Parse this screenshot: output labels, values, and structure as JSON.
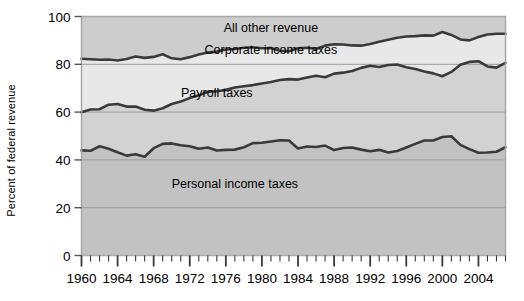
{
  "chart_data": {
    "type": "area",
    "title": "",
    "subtitle": "",
    "xlabel": "",
    "ylabel": "Percent of federal revenue",
    "xlim": [
      1960,
      2007
    ],
    "ylim": [
      0,
      100
    ],
    "grid": true,
    "stacked": true,
    "legend_position": "inline-annotations",
    "y_ticks": [
      0,
      20,
      40,
      60,
      80,
      100
    ],
    "y_tick_labels": [
      "0",
      "20",
      "40",
      "60",
      "80",
      "100"
    ],
    "x_ticks": [
      1960,
      1964,
      1968,
      1972,
      1976,
      1980,
      1984,
      1988,
      1992,
      1996,
      2000,
      2004
    ],
    "x_tick_labels": [
      "1960",
      "1964",
      "1968",
      "1972",
      "1976",
      "1980",
      "1984",
      "1988",
      "1992",
      "1996",
      "2000",
      "2004"
    ],
    "x_minor_tick_interval": 1,
    "annotations": [
      {
        "text": "All other revenue",
        "x": 1981,
        "y": 95
      },
      {
        "text": "Corporate income taxes",
        "x": 1981,
        "y": 86
      },
      {
        "text": "Payroll taxes",
        "x": 1975,
        "y": 68
      },
      {
        "text": "Personal income taxes",
        "x": 1977,
        "y": 30
      }
    ],
    "colors": {
      "all_other_revenue": "#cdcdcd",
      "corporate_income_taxes": "#e8e8e8",
      "payroll_taxes": "#d2d2d2",
      "personal_income_taxes": "#c2c2c2",
      "line": "#3a3a3a",
      "grid": "#9a9a9a",
      "frame": "#a8a8a8",
      "text": "#000000",
      "background": "#ffffff"
    },
    "x": [
      1960,
      1961,
      1962,
      1963,
      1964,
      1965,
      1966,
      1967,
      1968,
      1969,
      1970,
      1971,
      1972,
      1973,
      1974,
      1975,
      1976,
      1977,
      1978,
      1979,
      1980,
      1981,
      1982,
      1983,
      1984,
      1985,
      1986,
      1987,
      1988,
      1989,
      1990,
      1991,
      1992,
      1993,
      1994,
      1995,
      1996,
      1997,
      1998,
      1999,
      2000,
      2001,
      2002,
      2003,
      2004,
      2005,
      2006,
      2007
    ],
    "series": [
      {
        "name": "Personal income taxes",
        "cumulative_top": [
          44.0,
          43.8,
          45.7,
          44.7,
          43.2,
          41.8,
          42.4,
          41.3,
          44.9,
          46.7,
          46.9,
          46.1,
          45.7,
          44.7,
          45.2,
          43.9,
          44.2,
          44.3,
          45.3,
          47.0,
          47.2,
          47.7,
          48.2,
          48.1,
          44.8,
          45.6,
          45.4,
          46.0,
          44.1,
          45.0,
          45.2,
          44.3,
          43.6,
          44.2,
          43.1,
          43.7,
          45.2,
          46.7,
          48.1,
          48.1,
          49.6,
          49.9,
          46.3,
          44.5,
          43.0,
          43.1,
          43.4,
          45.3
        ]
      },
      {
        "name": "Payroll taxes",
        "cumulative_top": [
          59.9,
          61.1,
          61.2,
          63.1,
          63.4,
          62.3,
          62.3,
          61.0,
          60.6,
          61.6,
          63.4,
          64.4,
          65.9,
          67.0,
          68.5,
          68.7,
          69.3,
          70.3,
          70.8,
          71.3,
          72.0,
          72.6,
          73.4,
          73.8,
          73.6,
          74.5,
          75.2,
          74.6,
          76.1,
          76.5,
          77.2,
          78.5,
          79.4,
          78.9,
          79.7,
          79.9,
          78.8,
          78.0,
          77.0,
          76.2,
          75.0,
          76.8,
          79.8,
          81.0,
          81.3,
          79.1,
          78.6,
          80.6
        ]
      },
      {
        "name": "Corporate income taxes",
        "cumulative_top": [
          82.3,
          82.1,
          81.9,
          82.0,
          81.6,
          82.2,
          83.3,
          82.7,
          83.1,
          84.2,
          82.5,
          82.1,
          83.0,
          84.1,
          84.9,
          85.3,
          86.2,
          86.4,
          86.9,
          87.1,
          86.7,
          86.8,
          85.7,
          85.4,
          86.7,
          86.9,
          86.4,
          87.8,
          88.4,
          88.3,
          87.9,
          87.8,
          88.5,
          89.4,
          90.3,
          91.1,
          91.6,
          91.8,
          92.1,
          92.0,
          93.5,
          92.3,
          90.4,
          90.0,
          91.4,
          92.5,
          92.8,
          92.8
        ]
      },
      {
        "name": "All other revenue",
        "cumulative_top": [
          100,
          100,
          100,
          100,
          100,
          100,
          100,
          100,
          100,
          100,
          100,
          100,
          100,
          100,
          100,
          100,
          100,
          100,
          100,
          100,
          100,
          100,
          100,
          100,
          100,
          100,
          100,
          100,
          100,
          100,
          100,
          100,
          100,
          100,
          100,
          100,
          100,
          100,
          100,
          100,
          100,
          100,
          100,
          100,
          100,
          100,
          100,
          100
        ]
      }
    ]
  },
  "axis": {
    "y_label": "Percent of federal revenue"
  }
}
